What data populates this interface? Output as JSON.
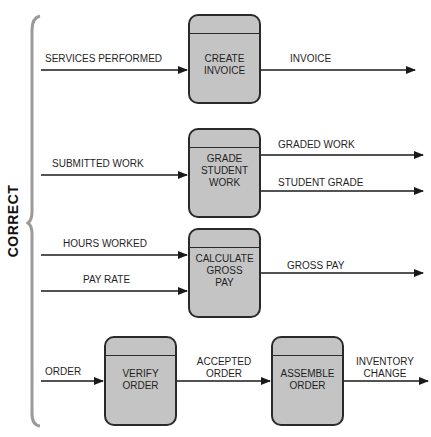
{
  "side_label": "CORRECT",
  "processes": [
    {
      "id": "create-invoice",
      "label": "CREATE\nINVOICE"
    },
    {
      "id": "grade-student-work",
      "label": "GRADE\nSTUDENT\nWORK"
    },
    {
      "id": "calculate-gross-pay",
      "label": "CALCULATE\nGROSS\nPAY"
    },
    {
      "id": "verify-order",
      "label": "VERIFY\nORDER"
    },
    {
      "id": "assemble-order",
      "label": "ASSEMBLE\nORDER"
    }
  ],
  "flows": {
    "services_performed": "SERVICES PERFORMED",
    "invoice": "INVOICE",
    "submitted_work": "SUBMITTED WORK",
    "graded_work": "GRADED WORK",
    "student_grade": "STUDENT GRADE",
    "hours_worked": "HOURS WORKED",
    "pay_rate": "PAY RATE",
    "gross_pay": "GROSS PAY",
    "order": "ORDER",
    "accepted_order_1": "ACCEPTED",
    "accepted_order_2": "ORDER",
    "inventory_change_1": "INVENTORY",
    "inventory_change_2": "CHANGE"
  },
  "colors": {
    "process_fill": "#c4c4c4",
    "line": "#1a1a1a",
    "brace": "#9a9a9a"
  }
}
